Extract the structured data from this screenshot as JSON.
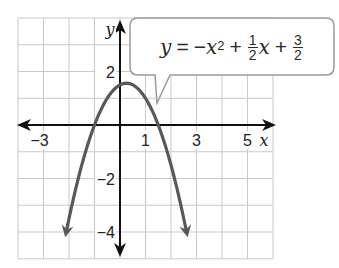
{
  "chart_data": {
    "type": "line",
    "title": "",
    "equation": "y = -x^2 + 1/2 x + 3/2",
    "xlabel": "x",
    "ylabel": "y",
    "xlim": [
      -4,
      6
    ],
    "ylim": [
      -5,
      4
    ],
    "grid": true,
    "x_tick_labels": [
      "-3",
      "1",
      "3",
      "5"
    ],
    "y_tick_labels": [
      "2",
      "-2",
      "-4"
    ],
    "series": [
      {
        "name": "y = -x^2 + (1/2)x + 3/2",
        "vertex": [
          0.25,
          1.5625
        ],
        "roots": [
          -1,
          1.5
        ],
        "y_intercept": 1.5,
        "x": [
          -2.2,
          -2,
          -1.5,
          -1,
          -0.5,
          0,
          0.25,
          0.5,
          1,
          1.5,
          2,
          2.5,
          2.7
        ],
        "y": [
          -4.44,
          -3.5,
          -1.5,
          0,
          1.0,
          1.5,
          1.5625,
          1.5,
          1.0,
          0,
          -1.5,
          -3.5,
          -4.44
        ],
        "color": "#585858"
      }
    ]
  },
  "labels": {
    "x_axis_name": "x",
    "y_axis_name": "y",
    "x_ticks": [
      {
        "value": -3,
        "text": "−3"
      },
      {
        "value": 1,
        "text": "1"
      },
      {
        "value": 3,
        "text": "3"
      },
      {
        "value": 5,
        "text": "5"
      }
    ],
    "y_ticks": [
      {
        "value": 2,
        "text": "2"
      },
      {
        "value": -2,
        "text": "−2"
      },
      {
        "value": -4,
        "text": "−4"
      }
    ]
  },
  "callout": {
    "y": "y",
    "equals": "=",
    "neg": "−",
    "x1": "x",
    "exp": "2",
    "plus1": "+",
    "frac1_num": "1",
    "frac1_den": "2",
    "x2": "x",
    "plus2": "+",
    "frac2_num": "3",
    "frac2_den": "2"
  },
  "colors": {
    "curve": "#585858",
    "grid": "#c9c9c9",
    "axis": "#111111"
  }
}
